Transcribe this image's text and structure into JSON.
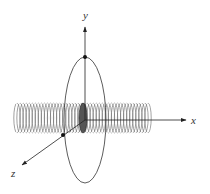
{
  "diagram": {
    "type": "solenoid-with-circular-loop",
    "axes": {
      "x": {
        "label": "x"
      },
      "y": {
        "label": "y"
      },
      "z": {
        "label": "z"
      }
    },
    "colors": {
      "line": "#222222",
      "coil": "#777777",
      "coil_faded": "#d8d8d8",
      "background": "#ffffff"
    },
    "coil_turns": 44,
    "points": [
      "top-of-loop",
      "loop-z-intersection"
    ]
  }
}
